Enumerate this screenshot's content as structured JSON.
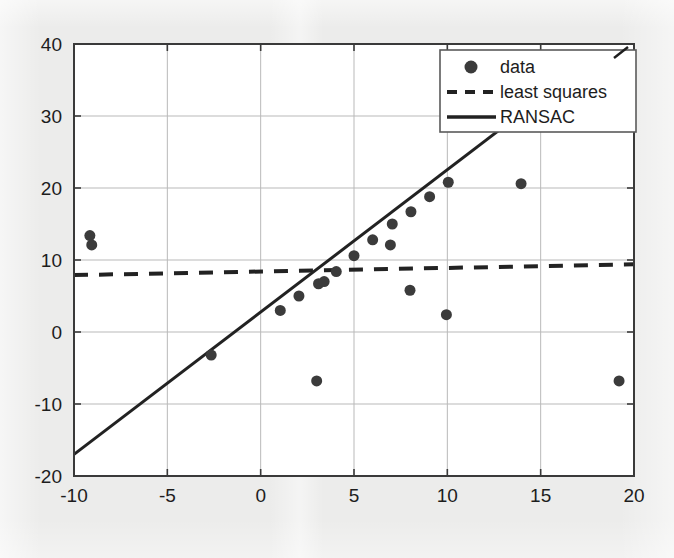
{
  "chart_data": {
    "type": "scatter",
    "title": "",
    "subtitle": "",
    "xlabel": "",
    "ylabel": "",
    "xlim": [
      -10,
      20
    ],
    "ylim": [
      -20,
      40
    ],
    "xticks": [
      -10,
      -5,
      0,
      5,
      10,
      15,
      20
    ],
    "yticks": [
      -20,
      -10,
      0,
      10,
      20,
      30,
      40
    ],
    "xtick_labels": [
      "-10",
      "-5",
      "0",
      "5",
      "10",
      "15",
      "20"
    ],
    "ytick_labels": [
      "-20",
      "-10",
      "0",
      "10",
      "20",
      "30",
      "40"
    ],
    "grid": true,
    "grid_color": "#b9b9b9",
    "axes_color": "#3a3a3a",
    "background": "#ffffff",
    "page_background": "#ececeb",
    "legend_position": "upper right",
    "legend_entries": [
      {
        "label": "data",
        "marker": "circle",
        "style": "marker",
        "color": "#3b3b3b"
      },
      {
        "label": "least squares",
        "marker": "none",
        "style": "dashed",
        "color": "#222222"
      },
      {
        "label": "RANSAC",
        "marker": "none",
        "style": "solid",
        "color": "#222222"
      }
    ],
    "series": [
      {
        "name": "data",
        "type": "scatter",
        "marker": "circle",
        "marker_size": 11,
        "color": "#3b3b3b",
        "points": [
          {
            "x": -9.15,
            "y": 13.4
          },
          {
            "x": -9.05,
            "y": 12.1
          },
          {
            "x": -2.65,
            "y": -3.2
          },
          {
            "x": 1.05,
            "y": 3.0
          },
          {
            "x": 2.05,
            "y": 5.0
          },
          {
            "x": 3.0,
            "y": -6.8
          },
          {
            "x": 3.1,
            "y": 6.7
          },
          {
            "x": 3.4,
            "y": 7.0
          },
          {
            "x": 4.05,
            "y": 8.4
          },
          {
            "x": 5.0,
            "y": 10.6
          },
          {
            "x": 6.0,
            "y": 12.8
          },
          {
            "x": 6.95,
            "y": 12.1
          },
          {
            "x": 7.05,
            "y": 15.0
          },
          {
            "x": 8.0,
            "y": 5.8
          },
          {
            "x": 8.05,
            "y": 16.7
          },
          {
            "x": 9.05,
            "y": 18.8
          },
          {
            "x": 9.95,
            "y": 2.4
          },
          {
            "x": 10.05,
            "y": 20.8
          },
          {
            "x": 13.95,
            "y": 20.6
          },
          {
            "x": 19.2,
            "y": -6.8
          }
        ]
      },
      {
        "name": "least squares",
        "type": "line",
        "style": "dashed",
        "color": "#222222",
        "line_width": 4,
        "endpoints": [
          {
            "x": -10,
            "y": 7.9
          },
          {
            "x": 20,
            "y": 9.4
          }
        ],
        "slope": 0.05,
        "intercept": 8.4
      },
      {
        "name": "RANSAC",
        "type": "line",
        "style": "solid",
        "color": "#222222",
        "line_width": 3,
        "endpoints": [
          {
            "x": -10,
            "y": -17.0
          },
          {
            "x": 15.8,
            "y": 34.0
          }
        ],
        "slope": 1.98,
        "intercept": 2.8
      }
    ]
  }
}
